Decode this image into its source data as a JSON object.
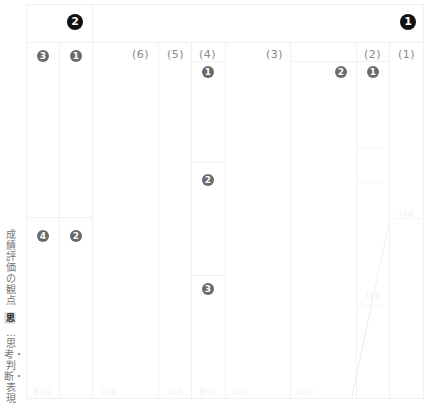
{
  "header": {
    "left_group_number": "2",
    "right_group_number": "1"
  },
  "columns": [
    {
      "id": "c1",
      "sub_number": "3",
      "lower_number": "4"
    },
    {
      "id": "c2",
      "sub_number": "1",
      "lower_number": "2"
    },
    {
      "id": "c3",
      "label": "(6)"
    },
    {
      "id": "c4",
      "label": "(5)"
    },
    {
      "id": "c5",
      "label": "(4)",
      "numbers": [
        "1",
        "2",
        "3"
      ]
    },
    {
      "id": "c6",
      "label": "(3)"
    },
    {
      "id": "c7",
      "number": "2"
    },
    {
      "id": "c8",
      "label": "(2)",
      "number": "1"
    },
    {
      "id": "c9",
      "label": "(1)"
    }
  ],
  "side_label": {
    "title": "成績評価の観点",
    "badge": "思",
    "description": "…思考・判断・表現"
  },
  "footer_cells": [
    "各5点",
    "10点",
    "10点",
    "各5点",
    "10点",
    "10点"
  ],
  "faint_marks": [
    "10点",
    "10点"
  ]
}
